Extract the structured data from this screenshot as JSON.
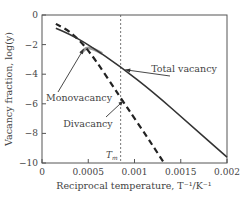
{
  "chart_data": {
    "type": "line",
    "title": "",
    "xlabel": "Reciprocal temperature, T⁻¹/K⁻¹",
    "ylabel": "Vacancy fraction, log(y)",
    "xlim": [
      0,
      0.002
    ],
    "ylim": [
      -10,
      0
    ],
    "x_ticks": [
      0,
      0.0005,
      0.001,
      0.0015,
      0.002
    ],
    "x_tick_labels": [
      "0",
      "0.0005",
      "0.001",
      "0.0015",
      "0.002"
    ],
    "y_ticks": [
      0,
      -2,
      -4,
      -6,
      -8,
      -10
    ],
    "y_tick_labels": [
      "0",
      "−2",
      "−4",
      "−6",
      "−8",
      "−10"
    ],
    "grid": false,
    "series": [
      {
        "name": "Total vacancy",
        "style": "solid",
        "color": "#333333",
        "x": [
          0.00015,
          0.0003,
          0.0005,
          0.00085,
          0.0012,
          0.0016,
          0.002
        ],
        "y": [
          -0.9,
          -1.3,
          -2.0,
          -3.5,
          -5.2,
          -7.4,
          -9.6
        ]
      },
      {
        "name": "Monovacancy",
        "style": "solid",
        "color": "#999999",
        "x": [
          0.00042,
          0.00046,
          0.0005,
          0.00056,
          0.00065
        ],
        "y": [
          -2.6,
          -2.3,
          -2.2,
          -2.3,
          -2.6
        ]
      },
      {
        "name": "Divacancy",
        "style": "dashed",
        "color": "#222222",
        "x": [
          0.00015,
          0.0003,
          0.0005,
          0.00085,
          0.0011,
          0.00132
        ],
        "y": [
          -0.6,
          -1.1,
          -2.3,
          -5.6,
          -7.9,
          -10.0
        ]
      }
    ],
    "reference_lines": [
      {
        "name": "Tm",
        "label": "T",
        "label_sub": "m",
        "x": 0.00085,
        "style": "dotted"
      }
    ],
    "annotations": [
      {
        "text": "Total vacancy",
        "points_to": [
          0.0009,
          -3.7
        ]
      },
      {
        "text": "Monovacancy",
        "points_to": [
          0.00045,
          -2.3
        ]
      },
      {
        "text": "Divacancy",
        "points_to": [
          0.00088,
          -5.8
        ]
      }
    ]
  }
}
